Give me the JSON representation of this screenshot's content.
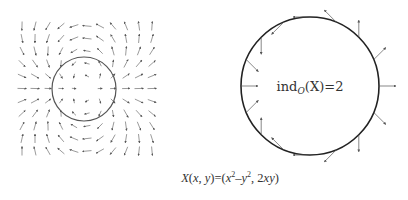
{
  "figure": {
    "left_panel": {
      "description": "vector field grid of X(x,y)=(x^2-y^2, 2xy) around origin",
      "circle": {
        "cx": 84,
        "cy": 89,
        "r": 32
      },
      "grid": {
        "x_start": 22,
        "x_step": 13,
        "cols": 11,
        "y_start": 26,
        "y_step": 12.5,
        "rows": 11
      },
      "arrow_color": "#555555",
      "circle_color": "#555555"
    },
    "right_panel": {
      "circle": {
        "cx": 310,
        "cy": 86,
        "r": 69
      },
      "arrow_count": 16,
      "arrow_length": 17,
      "circle_color": "#222222",
      "arrow_color": "#555555",
      "index_label": {
        "prefix": "ind",
        "subscript": "O",
        "argument": "(X)",
        "equals": "=2"
      }
    },
    "formula": {
      "lhs_name": "X",
      "lhs_args_open": "(",
      "lhs_x": "x",
      "lhs_sep": ", ",
      "lhs_y": "y",
      "lhs_args_close": ")",
      "equals": "=",
      "rhs_open": "(",
      "rhs_x": "x",
      "rhs_exp1": "2",
      "rhs_minus": "–",
      "rhs_y": "y",
      "rhs_exp2": "2",
      "rhs_sep": ", 2",
      "rhs_xy": "xy",
      "rhs_close": ")"
    }
  }
}
